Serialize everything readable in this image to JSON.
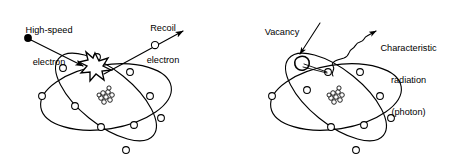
{
  "figure": {
    "title": "",
    "background_color": "#ffffff",
    "ink_color": "#000000",
    "panels": [
      {
        "id": "left",
        "name": "bremsstrahlung-ionization-panel",
        "description": "High-speed electron strikes an inner-shell electron of an atom, producing a recoil electron",
        "labels": [
          {
            "name": "high-speed-electron-label",
            "text": "High-speed\nelectron",
            "line1": "High-speed",
            "line2": "electron"
          },
          {
            "name": "recoil-electron-label",
            "text": "Recoil\nelectron",
            "line1": "Recoil",
            "line2": "electron"
          }
        ],
        "elements": {
          "incident_marker": "filled-dot",
          "interaction_marker": "starburst",
          "nucleus": "nucleus-cluster",
          "orbit_count": 2,
          "electron_count": 11
        }
      },
      {
        "id": "right",
        "name": "characteristic-radiation-panel",
        "description": "An inner-shell vacancy is filled by an outer electron, emitting a characteristic x-ray photon",
        "labels": [
          {
            "name": "vacancy-label",
            "text": "Vacancy",
            "line1": "Vacancy",
            "line2": "",
            "line3": ""
          },
          {
            "name": "characteristic-radiation-label",
            "text": "Characteristic\nradiation\n(photon)",
            "line1": "Characteristic",
            "line2": "radiation",
            "line3": "(photon)"
          }
        ],
        "elements": {
          "vacancy_marker": "irregular-blob",
          "photon_marker": "wavy-arrow",
          "nucleus": "nucleus-cluster",
          "orbit_count": 2,
          "electron_count": 10
        }
      }
    ]
  }
}
